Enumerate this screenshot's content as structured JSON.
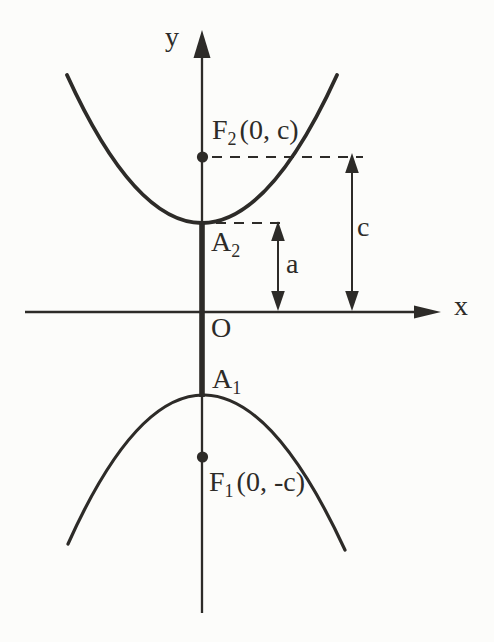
{
  "colors": {
    "background": "#fcfcfa",
    "ink": "#2d2b28"
  },
  "axes": {
    "y_label": "y",
    "x_label": "x",
    "origin_label": "O"
  },
  "labels": {
    "focus_upper": {
      "letter": "F",
      "sub": "2",
      "coords": "(0, c)"
    },
    "focus_lower": {
      "letter": "F",
      "sub": "1",
      "coords": "(0, -c)"
    },
    "vertex_upper": {
      "letter": "A",
      "sub": "2"
    },
    "vertex_lower": {
      "letter": "A",
      "sub": "1"
    },
    "distance_a": "a",
    "distance_c": "c"
  }
}
